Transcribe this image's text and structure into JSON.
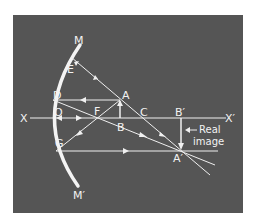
{
  "figure": {
    "colors": {
      "background": "#555555",
      "lines": "#f0f0f0",
      "page": "#ffffff"
    },
    "labels": {
      "mirror_top": "M",
      "mirror_bottom": "M′",
      "axis_left": "X",
      "axis_right": "X′",
      "E": "E",
      "D": "D",
      "O": "O",
      "F": "F",
      "G": "G",
      "A": "A",
      "B": "B",
      "C": "C",
      "B_prime": "B′",
      "A_prime": "A′",
      "image_note_line1": "Real",
      "image_note_line2": "image"
    }
  }
}
